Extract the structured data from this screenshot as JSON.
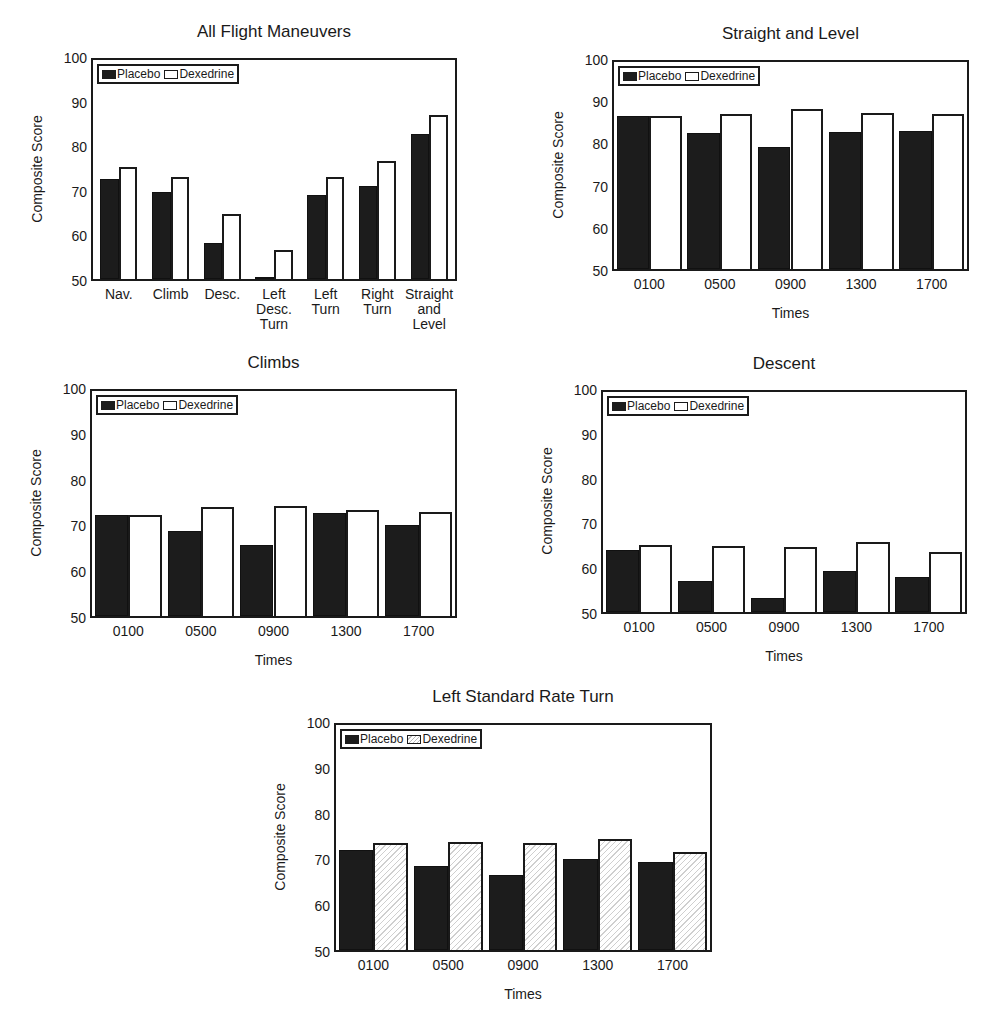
{
  "colors": {
    "placebo": "#1c1c1c",
    "dexedrine": "#ffffff",
    "axis": "#1a1a1a"
  },
  "legend": {
    "placebo": "Placebo",
    "dexedrine": "Dexedrine"
  },
  "chart_data": [
    {
      "id": "all-flight-maneuvers",
      "type": "bar",
      "title": "All Flight Maneuvers",
      "xlabel": "",
      "ylabel": "Composite Score",
      "ylim": [
        50,
        100
      ],
      "yticks": [
        50,
        60,
        70,
        80,
        90,
        100
      ],
      "grid": false,
      "legend_position": "upper left",
      "categories": [
        "Nav.",
        "Climb",
        "Desc.",
        "Left\nDesc.\nTurn",
        "Left\nTurn",
        "Right\nTurn",
        "Straight\nand\nLevel"
      ],
      "series": [
        {
          "name": "Placebo",
          "values": [
            72.6,
            69.6,
            58.2,
            50.0,
            69.0,
            71.1,
            82.7
          ]
        },
        {
          "name": "Dexedrine",
          "values": [
            75.4,
            73.1,
            64.6,
            56.6,
            73.1,
            76.6,
            87.2
          ]
        }
      ]
    },
    {
      "id": "straight-and-level",
      "type": "bar",
      "title": "Straight and Level",
      "xlabel": "Times",
      "ylabel": "Composite Score",
      "ylim": [
        50,
        100
      ],
      "yticks": [
        50,
        60,
        70,
        80,
        90,
        100
      ],
      "grid": false,
      "legend_position": "upper left",
      "categories": [
        "0100",
        "0500",
        "0900",
        "1300",
        "1700"
      ],
      "series": [
        {
          "name": "Placebo",
          "values": [
            86.7,
            82.5,
            79.1,
            82.8,
            83.1
          ]
        },
        {
          "name": "Dexedrine",
          "values": [
            86.7,
            87.0,
            88.2,
            87.3,
            87.0
          ]
        }
      ]
    },
    {
      "id": "climbs",
      "type": "bar",
      "title": "Climbs",
      "xlabel": "Times",
      "ylabel": "Composite Score",
      "ylim": [
        50,
        100
      ],
      "yticks": [
        50,
        60,
        70,
        80,
        90,
        100
      ],
      "grid": false,
      "legend_position": "upper left",
      "categories": [
        "0100",
        "0500",
        "0900",
        "1300",
        "1700"
      ],
      "series": [
        {
          "name": "Placebo",
          "values": [
            72.3,
            68.7,
            65.7,
            72.6,
            70.0
          ]
        },
        {
          "name": "Dexedrine",
          "values": [
            72.3,
            74.0,
            74.2,
            73.4,
            72.9
          ]
        }
      ]
    },
    {
      "id": "descent",
      "type": "bar",
      "title": "Descent",
      "xlabel": "Times",
      "ylabel": "Composite Score",
      "ylim": [
        50,
        100
      ],
      "yticks": [
        50,
        60,
        70,
        80,
        90,
        100
      ],
      "grid": false,
      "legend_position": "upper left",
      "categories": [
        "0100",
        "0500",
        "0900",
        "1300",
        "1700"
      ],
      "series": [
        {
          "name": "Placebo",
          "values": [
            64.0,
            56.9,
            53.2,
            59.2,
            57.9
          ]
        },
        {
          "name": "Dexedrine",
          "values": [
            65.0,
            64.9,
            64.7,
            65.7,
            63.5
          ]
        }
      ]
    },
    {
      "id": "left-standard-rate-turn",
      "type": "bar",
      "title": "Left Standard Rate Turn",
      "xlabel": "Times",
      "ylabel": "Composite Score",
      "ylim": [
        50,
        100
      ],
      "yticks": [
        50,
        60,
        70,
        80,
        90,
        100
      ],
      "grid": false,
      "legend_position": "upper left",
      "categories": [
        "0100",
        "0500",
        "0900",
        "1300",
        "1700"
      ],
      "series": [
        {
          "name": "Placebo",
          "values": [
            72.1,
            68.6,
            66.6,
            70.0,
            69.3
          ]
        },
        {
          "name": "Dexedrine",
          "values": [
            73.6,
            73.8,
            73.6,
            74.4,
            71.5
          ]
        }
      ]
    }
  ]
}
